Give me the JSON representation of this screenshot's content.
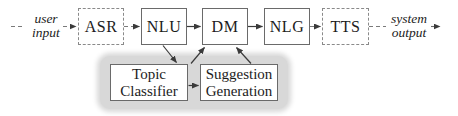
{
  "colors": {
    "background": "#ffffff",
    "box_border_solid": "#6a6a6a",
    "box_border_dashed": "#8a8a8a",
    "solid_arrow": "#3a3a3a",
    "dashed_line": "#7a7a7a",
    "highlight_region": "#d8d8d8",
    "text": "#1c1c1c"
  },
  "endpoints": {
    "input": {
      "line1": "user",
      "line2": "input"
    },
    "output": {
      "line1": "system",
      "line2": "output"
    }
  },
  "pipeline": {
    "nodes": [
      {
        "label": "ASR",
        "border": "dashed"
      },
      {
        "label": "NLU",
        "border": "solid"
      },
      {
        "label": "DM",
        "border": "solid"
      },
      {
        "label": "NLG",
        "border": "solid"
      },
      {
        "label": "TTS",
        "border": "dashed"
      }
    ]
  },
  "submodules": {
    "nodes": [
      {
        "line1": "Topic",
        "line2": "Classifier"
      },
      {
        "line1": "Suggestion",
        "line2": "Generation"
      }
    ]
  },
  "connections": [
    {
      "from": "user input",
      "to": "ASR",
      "style": "dashed"
    },
    {
      "from": "ASR",
      "to": "NLU",
      "style": "dashed"
    },
    {
      "from": "NLU",
      "to": "DM",
      "style": "solid"
    },
    {
      "from": "DM",
      "to": "NLG",
      "style": "solid"
    },
    {
      "from": "NLG",
      "to": "TTS",
      "style": "dashed"
    },
    {
      "from": "TTS",
      "to": "system output",
      "style": "dashed"
    },
    {
      "from": "NLU",
      "to": "Topic Classifier",
      "style": "solid"
    },
    {
      "from": "Topic Classifier",
      "to": "DM",
      "style": "solid"
    },
    {
      "from": "Suggestion Generation",
      "to": "DM",
      "style": "solid"
    },
    {
      "from": "Topic Classifier",
      "to": "Suggestion Generation",
      "style": "solid"
    }
  ]
}
